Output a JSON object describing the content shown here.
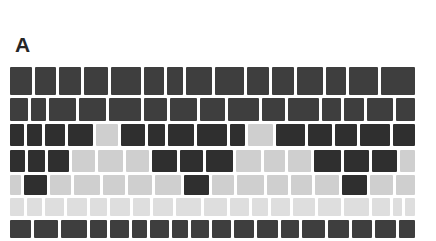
{
  "figure": {
    "panel_label": "A",
    "colors": {
      "dark": "#2f2f2f",
      "mid": "#3e3e3e",
      "light": "#cfcfcf",
      "pale": "#dedede"
    },
    "rows": [
      {
        "top": 0,
        "height": 28,
        "tiles": [
          "mid",
          "mid",
          "mid",
          "mid",
          "mid",
          "mid",
          "mid",
          "mid",
          "mid",
          "mid",
          "mid",
          "mid",
          "mid",
          "mid",
          "mid"
        ],
        "widths": [
          22,
          22,
          22,
          24,
          31,
          20,
          16,
          26,
          30,
          22,
          22,
          27,
          20,
          30,
          34
        ]
      },
      {
        "top": 31,
        "height": 23,
        "tiles": [
          "mid",
          "mid",
          "mid",
          "mid",
          "mid",
          "mid",
          "mid",
          "mid",
          "mid",
          "mid",
          "mid",
          "mid",
          "mid",
          "mid",
          "mid"
        ],
        "widths": [
          17,
          15,
          26,
          26,
          31,
          22,
          26,
          24,
          30,
          22,
          30,
          18,
          20,
          25,
          18
        ]
      },
      {
        "top": 57,
        "height": 22,
        "tiles": [
          "dark",
          "dark",
          "dark",
          "dark",
          "light",
          "dark",
          "dark",
          "dark",
          "dark",
          "dark",
          "light",
          "dark",
          "dark",
          "dark",
          "dark",
          "dark"
        ],
        "widths": [
          14,
          15,
          19,
          25,
          22,
          24,
          16,
          26,
          30,
          15,
          24,
          29,
          24,
          22,
          29,
          22
        ]
      },
      {
        "top": 83,
        "height": 22,
        "tiles": [
          "dark",
          "dark",
          "dark",
          "light",
          "light",
          "light",
          "dark",
          "dark",
          "dark",
          "light",
          "light",
          "light",
          "dark",
          "dark",
          "dark",
          "light"
        ],
        "widths": [
          16,
          17,
          22,
          24,
          26,
          24,
          26,
          24,
          28,
          26,
          22,
          24,
          28,
          26,
          26,
          16
        ]
      },
      {
        "top": 108,
        "height": 20,
        "tiles": [
          "light",
          "dark",
          "light",
          "light",
          "light",
          "light",
          "light",
          "dark",
          "light",
          "light",
          "light",
          "light",
          "light",
          "dark",
          "light",
          "light"
        ],
        "widths": [
          12,
          24,
          22,
          27,
          23,
          26,
          27,
          26,
          24,
          28,
          22,
          22,
          26,
          26,
          24,
          20
        ]
      },
      {
        "top": 131,
        "height": 18,
        "tiles": [
          "pale",
          "pale",
          "pale",
          "pale",
          "pale",
          "pale",
          "pale",
          "pale",
          "pale",
          "pale",
          "pale",
          "pale",
          "pale",
          "pale",
          "pale",
          "pale",
          "pale",
          "pale",
          "pale"
        ],
        "widths": [
          14,
          16,
          20,
          20,
          18,
          20,
          18,
          20,
          26,
          24,
          20,
          16,
          20,
          22,
          24,
          26,
          18,
          10,
          10
        ]
      },
      {
        "top": 153,
        "height": 18,
        "tiles": [
          "mid",
          "mid",
          "mid",
          "mid",
          "mid",
          "mid",
          "mid",
          "mid",
          "mid",
          "mid",
          "mid",
          "mid",
          "mid",
          "mid",
          "mid",
          "mid",
          "mid",
          "mid"
        ],
        "widths": [
          20,
          24,
          25,
          17,
          18,
          15,
          18,
          16,
          18,
          18,
          20,
          20,
          18,
          22,
          20,
          20,
          20,
          16
        ]
      }
    ]
  }
}
